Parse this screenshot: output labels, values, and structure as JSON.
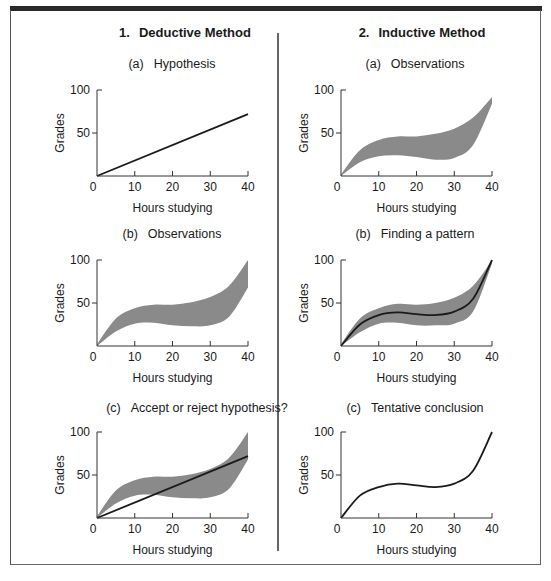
{
  "columns": [
    {
      "number": "1.",
      "title": "Deductive Method",
      "panels": [
        {
          "tag": "(a)",
          "title": "Hypothesis"
        },
        {
          "tag": "(b)",
          "title": "Observations"
        },
        {
          "tag": "(c)",
          "title": "Accept or reject hypothesis?"
        }
      ]
    },
    {
      "number": "2.",
      "title": "Inductive Method",
      "panels": [
        {
          "tag": "(a)",
          "title": "Observations"
        },
        {
          "tag": "(b)",
          "title": "Finding a pattern"
        },
        {
          "tag": "(c)",
          "title": "Tentative conclusion"
        }
      ]
    }
  ],
  "colors": {
    "band": "#8a8a8a",
    "line": "#1a1a1a",
    "axis": "#333333",
    "border": "#666666",
    "topbar": "#2a2a2a"
  },
  "chart_data": [
    {
      "id": "deductive-a",
      "type": "line",
      "title": "(a) Hypothesis",
      "xlabel": "Hours studying",
      "ylabel": "Grades",
      "xticks": [
        0,
        10,
        20,
        30,
        40
      ],
      "yticks": [
        50,
        100
      ],
      "xlim": [
        0,
        40
      ],
      "ylim": [
        0,
        100
      ],
      "series": [
        {
          "name": "hypothesis",
          "kind": "line",
          "x": [
            0,
            40
          ],
          "y": [
            0,
            72
          ]
        }
      ]
    },
    {
      "id": "deductive-b",
      "type": "area",
      "title": "(b) Observations",
      "xlabel": "Hours studying",
      "ylabel": "Grades",
      "xticks": [
        0,
        10,
        20,
        30,
        40
      ],
      "yticks": [
        50,
        100
      ],
      "xlim": [
        0,
        40
      ],
      "ylim": [
        0,
        100
      ],
      "series": [
        {
          "name": "observations",
          "kind": "band",
          "x": [
            0,
            5,
            10,
            15,
            20,
            25,
            30,
            35,
            40
          ],
          "upper": [
            2,
            32,
            44,
            48,
            48,
            51,
            57,
            70,
            100
          ],
          "lower": [
            0,
            17,
            26,
            27,
            24,
            23,
            24,
            34,
            68
          ]
        }
      ]
    },
    {
      "id": "deductive-c",
      "type": "area",
      "title": "(c) Accept or reject hypothesis?",
      "xlabel": "Hours studying",
      "ylabel": "Grades",
      "xticks": [
        0,
        10,
        20,
        30,
        40
      ],
      "yticks": [
        50,
        100
      ],
      "xlim": [
        0,
        40
      ],
      "ylim": [
        0,
        100
      ],
      "series": [
        {
          "name": "observations",
          "kind": "band",
          "x": [
            0,
            5,
            10,
            15,
            20,
            25,
            30,
            35,
            40
          ],
          "upper": [
            2,
            32,
            44,
            48,
            48,
            51,
            57,
            70,
            100
          ],
          "lower": [
            0,
            17,
            26,
            27,
            24,
            23,
            24,
            34,
            68
          ]
        },
        {
          "name": "hypothesis",
          "kind": "line",
          "x": [
            0,
            40
          ],
          "y": [
            0,
            72
          ]
        }
      ]
    },
    {
      "id": "inductive-a",
      "type": "area",
      "title": "(a) Observations",
      "xlabel": "Hours studying",
      "ylabel": "Grades",
      "xticks": [
        0,
        10,
        20,
        30,
        40
      ],
      "yticks": [
        50,
        100
      ],
      "xlim": [
        0,
        40
      ],
      "ylim": [
        0,
        100
      ],
      "series": [
        {
          "name": "observations",
          "kind": "band",
          "x": [
            0,
            5,
            10,
            15,
            20,
            25,
            30,
            35,
            40
          ],
          "upper": [
            2,
            30,
            42,
            46,
            46,
            49,
            55,
            68,
            92
          ],
          "lower": [
            0,
            16,
            23,
            24,
            22,
            19,
            21,
            36,
            84
          ]
        }
      ]
    },
    {
      "id": "inductive-b",
      "type": "area",
      "title": "(b) Finding a pattern",
      "xlabel": "Hours studying",
      "ylabel": "Grades",
      "xticks": [
        0,
        10,
        20,
        30,
        40
      ],
      "yticks": [
        50,
        100
      ],
      "xlim": [
        0,
        40
      ],
      "ylim": [
        0,
        100
      ],
      "series": [
        {
          "name": "observations",
          "kind": "band",
          "x": [
            0,
            5,
            10,
            15,
            20,
            25,
            30,
            35,
            40
          ],
          "upper": [
            2,
            32,
            44,
            49,
            48,
            50,
            56,
            70,
            100
          ],
          "lower": [
            0,
            16,
            26,
            27,
            24,
            24,
            26,
            40,
            96
          ]
        },
        {
          "name": "pattern",
          "kind": "line",
          "x": [
            0,
            5,
            10,
            15,
            20,
            25,
            30,
            35,
            40
          ],
          "y": [
            0,
            25,
            36,
            39,
            37,
            36,
            40,
            55,
            100
          ]
        }
      ]
    },
    {
      "id": "inductive-c",
      "type": "line",
      "title": "(c) Tentative conclusion",
      "xlabel": "Hours studying",
      "ylabel": "Grades",
      "xticks": [
        0,
        10,
        20,
        30,
        40
      ],
      "yticks": [
        50,
        100
      ],
      "xlim": [
        0,
        40
      ],
      "ylim": [
        0,
        100
      ],
      "series": [
        {
          "name": "conclusion",
          "kind": "line",
          "x": [
            0,
            5,
            10,
            15,
            20,
            25,
            30,
            35,
            40
          ],
          "y": [
            0,
            26,
            36,
            40,
            38,
            36,
            40,
            55,
            100
          ]
        }
      ]
    }
  ]
}
